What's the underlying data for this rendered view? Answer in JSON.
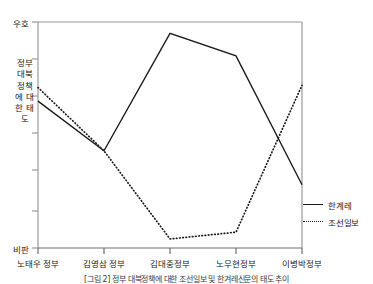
{
  "chart_data": {
    "type": "line",
    "title": "",
    "xlabel": "",
    "ylabel": "정부 대북정책에 대한 태도",
    "categories": [
      "노태우 정부",
      "김영삼 정부",
      "김대중정부",
      "노무현정부",
      "이병박정부"
    ],
    "ylim": [
      0,
      100
    ],
    "y_axis_top_label": "우호",
    "y_axis_bottom_label": "비판",
    "y_tick_count": 7,
    "grid": false,
    "legend_position": "right",
    "series": [
      {
        "name": "한계레",
        "style": "solid",
        "color": "#1a1a1a",
        "values": [
          65,
          43,
          95,
          85,
          28
        ]
      },
      {
        "name": "조선일보",
        "style": "dotted",
        "color": "#1a1a1a",
        "values": [
          71,
          43,
          4,
          7,
          72
        ]
      }
    ],
    "annotations": []
  },
  "caption": "[그림 2] 정부 대북정책에 대한 조선일보 및 한겨레신문의 태도 추이",
  "axis": {
    "frame_color": "#9a9a9a",
    "text_color": "#202020"
  }
}
